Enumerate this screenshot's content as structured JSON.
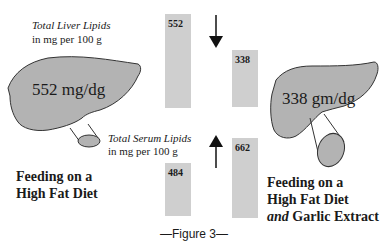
{
  "liver_caption": {
    "title": "Total Liver Lipids",
    "unit": "in mg per 100 g"
  },
  "serum_caption": {
    "title": "Total Serum Lipids",
    "unit": "in mg per 100 g"
  },
  "left_liver": {
    "value_text": "552 mg/dg"
  },
  "right_liver": {
    "value_text": "338 gm/dg"
  },
  "bars": {
    "liver_before": {
      "label": "552",
      "value": 552
    },
    "liver_after": {
      "label": "338",
      "value": 338
    },
    "serum_before": {
      "label": "484",
      "value": 484
    },
    "serum_after": {
      "label": "662",
      "value": 662
    }
  },
  "arrows": {
    "liver": "down",
    "serum": "up"
  },
  "left_group": {
    "line1": "Feeding on a",
    "line2": "High Fat Diet"
  },
  "right_group": {
    "line1": "Feeding on a",
    "line2": "High Fat Diet",
    "line3_italic": "and",
    "line3_rest": " Garlic Extract"
  },
  "figure_label": "—Figure 3—",
  "colors": {
    "bar": "#cfcfcf",
    "liver": "#b3b3b3",
    "outline": "#333333"
  }
}
